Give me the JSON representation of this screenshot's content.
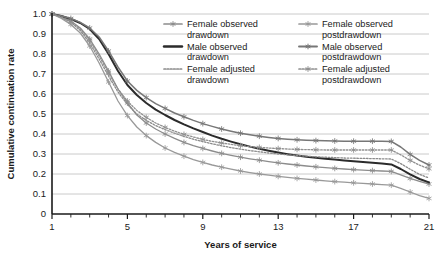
{
  "chart_data": {
    "type": "line",
    "title": "",
    "xlabel": "Years of service",
    "ylabel": "Cumulative continuation rate",
    "xlim": [
      1,
      21
    ],
    "ylim": [
      0,
      1.0
    ],
    "grid": "horizontal",
    "legend_position": "top-right-inside",
    "x_ticks": [
      1,
      5,
      9,
      13,
      17,
      21
    ],
    "x_tick_labels": [
      "1",
      "5",
      "9",
      "13",
      "17",
      "21"
    ],
    "x_minor_tick_step": 1,
    "y_ticks": [
      0,
      0.1,
      0.2,
      0.3,
      0.4,
      0.5,
      0.6,
      0.7,
      0.8,
      0.9,
      1.0
    ],
    "y_tick_labels": [
      "0",
      "0.1",
      "0.2",
      "0.3",
      "0.4",
      "0.5",
      "0.6",
      "0.7",
      "0.8",
      "0.9",
      "1.0"
    ],
    "x": [
      1,
      1.5,
      2,
      2.5,
      3,
      3.5,
      4,
      4.5,
      5,
      5.5,
      6,
      6.5,
      7,
      7.5,
      8,
      8.5,
      9,
      9.5,
      10,
      10.5,
      11,
      11.5,
      12,
      12.5,
      13,
      13.5,
      14,
      14.5,
      15,
      15.5,
      16,
      16.5,
      17,
      17.5,
      18,
      18.5,
      19,
      19.5,
      20,
      20.5,
      21
    ],
    "series": [
      {
        "name": "Female observed drawdown",
        "color": "#8c8c8c",
        "style": "solid",
        "marker": "asterisk",
        "width": 1.3,
        "values": [
          1.0,
          0.985,
          0.965,
          0.93,
          0.875,
          0.8,
          0.715,
          0.625,
          0.555,
          0.495,
          0.455,
          0.425,
          0.4,
          0.378,
          0.358,
          0.342,
          0.328,
          0.315,
          0.303,
          0.293,
          0.284,
          0.276,
          0.269,
          0.262,
          0.256,
          0.25,
          0.245,
          0.24,
          0.236,
          0.232,
          0.228,
          0.225,
          0.222,
          0.219,
          0.217,
          0.215,
          0.213,
          0.196,
          0.178,
          0.163,
          0.15
        ]
      },
      {
        "name": "Male observed drawdown",
        "color": "#2b2b2b",
        "style": "solid",
        "marker": "none",
        "width": 2.0,
        "values": [
          1.0,
          0.99,
          0.975,
          0.955,
          0.925,
          0.875,
          0.8,
          0.715,
          0.645,
          0.595,
          0.555,
          0.522,
          0.495,
          0.47,
          0.448,
          0.428,
          0.41,
          0.392,
          0.376,
          0.362,
          0.349,
          0.337,
          0.326,
          0.316,
          0.307,
          0.299,
          0.292,
          0.286,
          0.281,
          0.276,
          0.272,
          0.268,
          0.264,
          0.26,
          0.256,
          0.252,
          0.248,
          0.225,
          0.198,
          0.175,
          0.158
        ]
      },
      {
        "name": "Female adjusted drawdown",
        "color": "#8a8a8a",
        "style": "dotted",
        "marker": "none",
        "width": 1.3,
        "values": [
          1.0,
          0.982,
          0.958,
          0.918,
          0.855,
          0.775,
          0.69,
          0.61,
          0.548,
          0.5,
          0.468,
          0.442,
          0.422,
          0.404,
          0.388,
          0.374,
          0.362,
          0.351,
          0.341,
          0.332,
          0.324,
          0.317,
          0.311,
          0.305,
          0.3,
          0.296,
          0.292,
          0.289,
          0.286,
          0.284,
          0.282,
          0.28,
          0.279,
          0.278,
          0.277,
          0.276,
          0.275,
          0.252,
          0.224,
          0.198,
          0.18
        ]
      },
      {
        "name": "Female observed postdrawdown",
        "color": "#999999",
        "style": "solid",
        "marker": "asterisk",
        "width": 1.3,
        "values": [
          1.0,
          0.978,
          0.948,
          0.905,
          0.84,
          0.755,
          0.66,
          0.565,
          0.492,
          0.435,
          0.392,
          0.358,
          0.33,
          0.308,
          0.289,
          0.272,
          0.258,
          0.245,
          0.234,
          0.224,
          0.215,
          0.207,
          0.2,
          0.194,
          0.188,
          0.183,
          0.178,
          0.174,
          0.17,
          0.166,
          0.162,
          0.159,
          0.156,
          0.153,
          0.15,
          0.147,
          0.144,
          0.128,
          0.11,
          0.092,
          0.078
        ]
      },
      {
        "name": "Male observed postdrawdown",
        "color": "#777777",
        "style": "solid",
        "marker": "asterisk",
        "width": 1.5,
        "values": [
          1.0,
          0.99,
          0.978,
          0.958,
          0.93,
          0.885,
          0.815,
          0.735,
          0.665,
          0.618,
          0.582,
          0.552,
          0.528,
          0.505,
          0.486,
          0.468,
          0.452,
          0.438,
          0.425,
          0.414,
          0.404,
          0.396,
          0.389,
          0.383,
          0.378,
          0.374,
          0.371,
          0.369,
          0.367,
          0.366,
          0.365,
          0.364,
          0.364,
          0.364,
          0.364,
          0.364,
          0.363,
          0.335,
          0.298,
          0.268,
          0.245
        ]
      },
      {
        "name": "Female adjusted postdrawdown",
        "color": "#8f8f8f",
        "style": "dotted",
        "marker": "asterisk",
        "width": 1.3,
        "values": [
          1.0,
          0.984,
          0.962,
          0.925,
          0.868,
          0.79,
          0.705,
          0.625,
          0.565,
          0.518,
          0.483,
          0.455,
          0.433,
          0.414,
          0.398,
          0.385,
          0.373,
          0.363,
          0.355,
          0.348,
          0.342,
          0.337,
          0.333,
          0.33,
          0.327,
          0.325,
          0.323,
          0.322,
          0.321,
          0.32,
          0.32,
          0.32,
          0.32,
          0.32,
          0.32,
          0.32,
          0.32,
          0.296,
          0.268,
          0.244,
          0.226
        ]
      }
    ]
  },
  "legend": {
    "items": [
      {
        "label_line1": "Female observed",
        "label_line2": "drawdown",
        "series_index": 0
      },
      {
        "label_line1": "Female observed",
        "label_line2": "postdrawdown",
        "series_index": 3
      },
      {
        "label_line1": "Male observed",
        "label_line2": "drawdown",
        "series_index": 1
      },
      {
        "label_line1": "Male observed",
        "label_line2": "postdrawdown",
        "series_index": 4
      },
      {
        "label_line1": "Female adjusted",
        "label_line2": "drawdown",
        "series_index": 2
      },
      {
        "label_line1": "Female adjusted",
        "label_line2": "postdrawdown",
        "series_index": 5
      }
    ]
  },
  "colors": {
    "axis": "#1a1a1a",
    "grid": "#bdbdbd",
    "background": "#ffffff",
    "text": "#1a1a1a"
  }
}
